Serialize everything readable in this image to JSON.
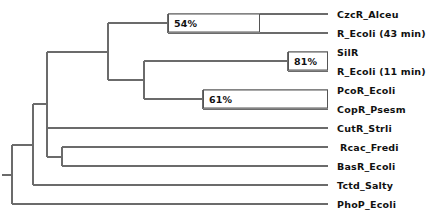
{
  "figure": {
    "kind": "phylogenetic-tree",
    "orientation": "left-to-right-rectangular-cladogram",
    "background_color": "#ffffff",
    "line_color": "#6b6b6b",
    "text_color": "#111111",
    "box_border_color": "#555555"
  },
  "leaves": [
    {
      "id": "czcr-alceu",
      "label": "CzcR_Alceu",
      "y": 14,
      "branch_x": 328
    },
    {
      "id": "r-ecoli-43",
      "label": "R_Ecoli (43 min)",
      "y": 33,
      "branch_x": 328
    },
    {
      "id": "silr",
      "label": "SilR",
      "y": 52,
      "branch_x": 328
    },
    {
      "id": "r-ecoli-11",
      "label": "R_Ecoli (11 min)",
      "y": 71,
      "branch_x": 328
    },
    {
      "id": "pcor-ecoli",
      "label": "PcoR_Ecoli",
      "y": 90,
      "branch_x": 328
    },
    {
      "id": "copr-psesm",
      "label": "CopR_Psesm",
      "y": 109,
      "branch_x": 328
    },
    {
      "id": "cutr-strli",
      "label": "CutR_Strli",
      "y": 128,
      "branch_x": 328
    },
    {
      "id": "rcac-fredi",
      "label": "Rcac_Fredi",
      "y": 147,
      "branch_x": 328
    },
    {
      "id": "basr-ecoli",
      "label": "BasR_Ecoli",
      "y": 166,
      "branch_x": 328
    },
    {
      "id": "tctd-salty",
      "label": "Tctd_Salty",
      "y": 185,
      "branch_x": 328
    },
    {
      "id": "phop-ecoli",
      "label": "PhoP_Ecoli",
      "y": 204,
      "branch_x": 328
    }
  ],
  "label_x": 337,
  "support_values": [
    {
      "id": "support-54",
      "label": "54%",
      "x": 168,
      "y": 23,
      "width": 92,
      "height": 19
    },
    {
      "id": "support-81",
      "label": "81%",
      "x": 288,
      "y": 61,
      "width": 40,
      "height": 19
    },
    {
      "id": "support-61",
      "label": "61%",
      "x": 203,
      "y": 99,
      "width": 125,
      "height": 19
    }
  ],
  "branches": {
    "root_x": 12,
    "nodes": [
      {
        "id": "node-clade-A",
        "x": 168,
        "y_top": 14,
        "y_bottom": 33,
        "parent_x": 108
      },
      {
        "id": "node-silr-recoli11",
        "x": 288,
        "y_top": 52,
        "y_bottom": 71,
        "parent_x": 203
      },
      {
        "id": "node-pcor-copr",
        "x": 203,
        "y_top": 90,
        "y_bottom": 109,
        "parent_x": 144
      },
      {
        "id": "node-clade-B",
        "x": 144,
        "y_top": 61,
        "y_bottom": 99,
        "parent_x": 108
      },
      {
        "id": "node-clade-AB",
        "x": 108,
        "y_top": 23,
        "y_bottom": 80,
        "parent_x": 47
      },
      {
        "id": "node-rcac-basr",
        "x": 62,
        "y_top": 147,
        "y_bottom": 166,
        "parent_x": 47
      },
      {
        "id": "node-cut-rcac-basr",
        "x": 47,
        "y_top": 52,
        "y_bottom": 157,
        "parent_x": 33
      },
      {
        "id": "node-plus-tctd",
        "x": 33,
        "y_top": 104,
        "y_bottom": 185,
        "parent_x": 12
      },
      {
        "id": "node-root",
        "x": 12,
        "y_top": 145,
        "y_bottom": 204,
        "parent_x": 2
      }
    ]
  },
  "tree_newick": "(PhoP_Ecoli,(Tctd_Salty,(CutR_Strli,(Rcac_Fredi,BasR_Ecoli)),(((CzcR_Alceu,R_Ecoli (43 min))54,((SilR,R_Ecoli (11 min))81,(PcoR_Ecoli,CopR_Psesm)61))));"
}
